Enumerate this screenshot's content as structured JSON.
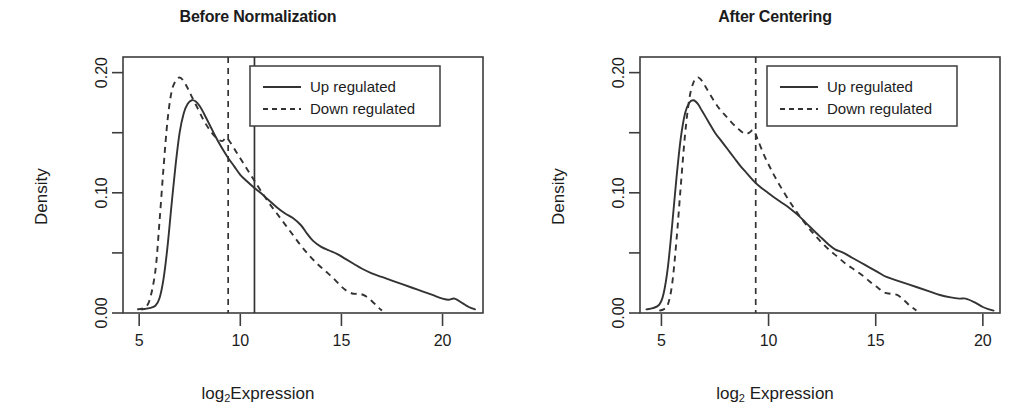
{
  "figure": {
    "background": "#ffffff",
    "line_color": "#333333",
    "axis_color": "#3d3d3d",
    "text_color": "#1c1c1c"
  },
  "chart_data": [
    {
      "type": "line",
      "panel_index": 0,
      "title": "Before Normalization",
      "xlabel": "log₂Expression",
      "xlabel_parts": {
        "pre": "log",
        "sub": "2",
        "post": "Expression"
      },
      "ylabel": "Density",
      "xlim": [
        4.2,
        22.0
      ],
      "ylim": [
        0.0,
        0.213
      ],
      "xticks": [
        5,
        10,
        15,
        20
      ],
      "xtick_labels": [
        "5",
        "10",
        "15",
        "20"
      ],
      "yticks": [
        0.0,
        0.05,
        0.1,
        0.15,
        0.2
      ],
      "ytick_labels": [
        "0.00",
        "",
        "0.10",
        "",
        "0.20"
      ],
      "grid": false,
      "legend_position": "top-right",
      "series": [
        {
          "name": "Up regulated",
          "style": "solid",
          "x": [
            5.1,
            5.5,
            5.8,
            6.0,
            6.2,
            6.4,
            6.6,
            6.8,
            7.0,
            7.2,
            7.4,
            7.6,
            7.8,
            8.0,
            8.2,
            8.5,
            8.8,
            9.1,
            9.4,
            9.7,
            10.0,
            10.3,
            10.7,
            11.0,
            11.4,
            11.8,
            12.2,
            12.6,
            13.0,
            13.3,
            13.6,
            14.0,
            14.4,
            14.8,
            15.2,
            15.6,
            16.0,
            16.5,
            17.0,
            17.5,
            18.0,
            18.5,
            19.0,
            19.5,
            20.0,
            20.3,
            20.6,
            21.0,
            21.3,
            21.6
          ],
          "y": [
            0.003,
            0.004,
            0.006,
            0.012,
            0.028,
            0.055,
            0.09,
            0.123,
            0.15,
            0.166,
            0.174,
            0.177,
            0.176,
            0.172,
            0.166,
            0.156,
            0.146,
            0.137,
            0.129,
            0.122,
            0.115,
            0.11,
            0.104,
            0.1,
            0.094,
            0.088,
            0.083,
            0.079,
            0.073,
            0.066,
            0.06,
            0.055,
            0.052,
            0.049,
            0.045,
            0.041,
            0.037,
            0.033,
            0.03,
            0.027,
            0.024,
            0.021,
            0.018,
            0.015,
            0.012,
            0.011,
            0.012,
            0.008,
            0.005,
            0.003
          ]
        },
        {
          "name": "Down regulated",
          "style": "dashed",
          "x": [
            4.9,
            5.2,
            5.5,
            5.8,
            6.0,
            6.2,
            6.4,
            6.6,
            6.8,
            7.0,
            7.2,
            7.4,
            7.6,
            7.9,
            8.2,
            8.5,
            8.8,
            9.1,
            9.3,
            9.5,
            9.8,
            10.1,
            10.4,
            10.7,
            11.0,
            11.4,
            11.8,
            12.2,
            12.6,
            13.0,
            13.4,
            13.8,
            14.2,
            14.6,
            15.0,
            15.3,
            15.6,
            15.9,
            16.2,
            16.5,
            16.8,
            17.0
          ],
          "y": [
            0.003,
            0.004,
            0.01,
            0.035,
            0.075,
            0.12,
            0.16,
            0.184,
            0.193,
            0.196,
            0.193,
            0.187,
            0.18,
            0.17,
            0.16,
            0.152,
            0.146,
            0.143,
            0.146,
            0.142,
            0.134,
            0.126,
            0.118,
            0.11,
            0.102,
            0.092,
            0.083,
            0.074,
            0.065,
            0.056,
            0.048,
            0.041,
            0.035,
            0.029,
            0.022,
            0.018,
            0.016,
            0.016,
            0.014,
            0.01,
            0.005,
            0.002
          ]
        }
      ],
      "vlines": [
        {
          "x": 9.4,
          "style": "dashed"
        },
        {
          "x": 10.7,
          "style": "solid"
        }
      ]
    },
    {
      "type": "line",
      "panel_index": 1,
      "title": "After Centering",
      "xlabel": "log₂ Expression",
      "xlabel_parts": {
        "pre": "log",
        "sub": "2",
        "post": " Expression"
      },
      "ylabel": "Density",
      "xlim": [
        4.0,
        20.8
      ],
      "ylim": [
        0.0,
        0.213
      ],
      "xticks": [
        5,
        10,
        15,
        20
      ],
      "xtick_labels": [
        "5",
        "10",
        "15",
        "20"
      ],
      "yticks": [
        0.0,
        0.05,
        0.1,
        0.15,
        0.2
      ],
      "ytick_labels": [
        "0.00",
        "",
        "0.10",
        "",
        "0.20"
      ],
      "grid": false,
      "legend_position": "top-right",
      "series": [
        {
          "name": "Up regulated",
          "style": "solid",
          "x": [
            4.3,
            4.6,
            4.9,
            5.1,
            5.3,
            5.5,
            5.7,
            5.9,
            6.1,
            6.3,
            6.5,
            6.7,
            6.9,
            7.2,
            7.5,
            7.8,
            8.1,
            8.4,
            8.7,
            9.0,
            9.3,
            9.6,
            9.9,
            10.2,
            10.6,
            11.0,
            11.4,
            11.8,
            12.2,
            12.5,
            12.8,
            13.1,
            13.5,
            13.9,
            14.3,
            14.7,
            15.1,
            15.5,
            16.0,
            16.5,
            17.0,
            17.5,
            18.0,
            18.5,
            18.9,
            19.2,
            19.6,
            20.0,
            20.3,
            20.5
          ],
          "y": [
            0.003,
            0.004,
            0.007,
            0.016,
            0.038,
            0.073,
            0.112,
            0.145,
            0.166,
            0.175,
            0.177,
            0.174,
            0.168,
            0.159,
            0.15,
            0.143,
            0.136,
            0.129,
            0.122,
            0.116,
            0.11,
            0.105,
            0.101,
            0.097,
            0.092,
            0.087,
            0.081,
            0.074,
            0.067,
            0.062,
            0.057,
            0.053,
            0.05,
            0.046,
            0.042,
            0.038,
            0.034,
            0.03,
            0.027,
            0.024,
            0.021,
            0.018,
            0.015,
            0.013,
            0.012,
            0.012,
            0.009,
            0.005,
            0.003,
            0.002
          ]
        },
        {
          "name": "Down regulated",
          "style": "dashed",
          "x": [
            4.9,
            5.1,
            5.3,
            5.5,
            5.7,
            5.9,
            6.1,
            6.3,
            6.5,
            6.7,
            6.9,
            7.1,
            7.4,
            7.7,
            8.0,
            8.3,
            8.6,
            8.9,
            9.1,
            9.3,
            9.5,
            9.8,
            10.1,
            10.4,
            10.8,
            11.2,
            11.6,
            12.0,
            12.4,
            12.8,
            13.2,
            13.6,
            14.0,
            14.4,
            14.8,
            15.1,
            15.4,
            15.7,
            16.0,
            16.3,
            16.6,
            16.9
          ],
          "y": [
            0.002,
            0.003,
            0.007,
            0.024,
            0.06,
            0.105,
            0.148,
            0.178,
            0.192,
            0.196,
            0.193,
            0.187,
            0.178,
            0.17,
            0.164,
            0.158,
            0.153,
            0.149,
            0.15,
            0.152,
            0.144,
            0.131,
            0.12,
            0.11,
            0.098,
            0.087,
            0.077,
            0.068,
            0.06,
            0.053,
            0.047,
            0.041,
            0.036,
            0.031,
            0.025,
            0.021,
            0.017,
            0.016,
            0.015,
            0.011,
            0.006,
            0.002
          ]
        }
      ],
      "vlines": [
        {
          "x": 9.4,
          "style": "dashed"
        }
      ]
    }
  ],
  "legend": {
    "entries": [
      {
        "label": "Up regulated",
        "style": "solid"
      },
      {
        "label": "Down regulated",
        "style": "dashed"
      }
    ]
  }
}
